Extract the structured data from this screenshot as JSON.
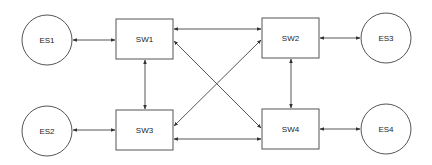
{
  "diagram": {
    "type": "network-topology",
    "colors": {
      "stroke": "#555555",
      "edge": "#444444",
      "text": "#222222",
      "background": "#ffffff"
    },
    "nodes": [
      {
        "id": "ES1",
        "label": "ES1",
        "shape": "circle",
        "cx": 47,
        "cy": 40,
        "r": 25
      },
      {
        "id": "ES2",
        "label": "ES2",
        "shape": "circle",
        "cx": 47,
        "cy": 131,
        "r": 25
      },
      {
        "id": "ES3",
        "label": "ES3",
        "shape": "circle",
        "cx": 386,
        "cy": 38,
        "r": 25
      },
      {
        "id": "ES4",
        "label": "ES4",
        "shape": "circle",
        "cx": 386,
        "cy": 129,
        "r": 25
      },
      {
        "id": "SW1",
        "label": "SW1",
        "shape": "rect",
        "x": 116,
        "y": 19,
        "w": 57,
        "h": 40
      },
      {
        "id": "SW2",
        "label": "SW2",
        "shape": "rect",
        "x": 262,
        "y": 18,
        "w": 57,
        "h": 40
      },
      {
        "id": "SW3",
        "label": "SW3",
        "shape": "rect",
        "x": 116,
        "y": 110,
        "w": 57,
        "h": 40
      },
      {
        "id": "SW4",
        "label": "SW4",
        "shape": "rect",
        "x": 262,
        "y": 109,
        "w": 57,
        "h": 40
      }
    ],
    "edges": [
      {
        "from": "ES1",
        "to": "SW1",
        "bidirectional": true
      },
      {
        "from": "ES2",
        "to": "SW3",
        "bidirectional": true
      },
      {
        "from": "SW2",
        "to": "ES3",
        "bidirectional": true
      },
      {
        "from": "SW4",
        "to": "ES4",
        "bidirectional": true
      },
      {
        "from": "SW1",
        "to": "SW2",
        "bidirectional": true
      },
      {
        "from": "SW3",
        "to": "SW4",
        "bidirectional": true
      },
      {
        "from": "SW1",
        "to": "SW3",
        "bidirectional": true
      },
      {
        "from": "SW2",
        "to": "SW4",
        "bidirectional": true
      },
      {
        "from": "SW1",
        "to": "SW4",
        "bidirectional": true
      },
      {
        "from": "SW3",
        "to": "SW2",
        "bidirectional": true
      }
    ]
  }
}
